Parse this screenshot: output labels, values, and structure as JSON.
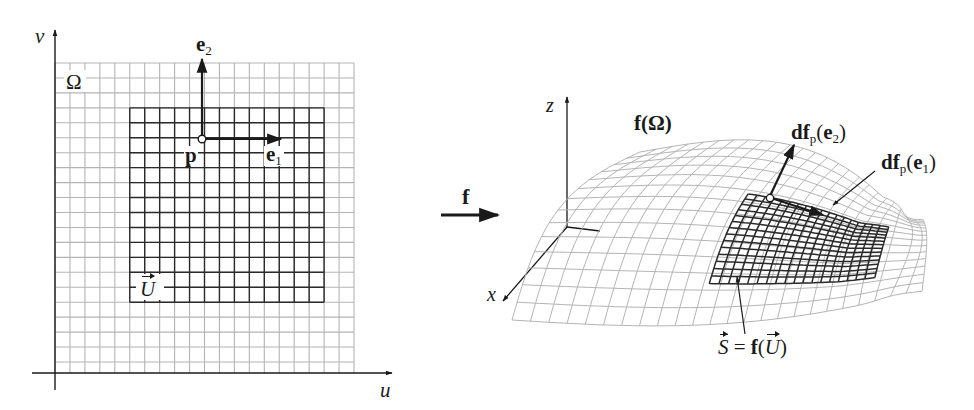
{
  "figure": {
    "colors": {
      "light_grid": "#b4b4b4",
      "dark_grid": "#2a2a2a",
      "axis": "#1a1a1a",
      "background": "#ffffff"
    },
    "left_panel": {
      "axis_u_label": "u",
      "axis_v_label": "v",
      "domain_label": "Ω",
      "subdomain_label": "U",
      "point_label": "p",
      "vector_e1_label": "e",
      "vector_e1_sub": "1",
      "vector_e2_label": "e",
      "vector_e2_sub": "2",
      "grid": {
        "x0": 55,
        "y0": 63,
        "cols": 20,
        "rows": 21,
        "spacing": 14.95,
        "dark_col_start": 5,
        "dark_col_end": 18,
        "dark_row_start": 3,
        "dark_row_end": 16
      }
    },
    "map_arrow": {
      "label": "f"
    },
    "right_panel": {
      "axis_x_label": "x",
      "axis_z_label": "z",
      "surface_label": "f(Ω)",
      "image_label_lhs": "S",
      "image_label_eq": " = ",
      "image_label_f": "f",
      "image_label_open": "(",
      "image_label_U": "U",
      "image_label_close": ")",
      "dfe2_label_prefix": "df",
      "dfe2_sub": "p",
      "dfe2_arg_open": "(",
      "dfe2_arg": "e",
      "dfe2_arg_sub": "2",
      "dfe2_arg_close": ")",
      "dfe1_label_prefix": "df",
      "dfe1_sub": "p",
      "dfe1_arg_open": "(",
      "dfe1_arg": "e",
      "dfe1_arg_sub": "1",
      "dfe1_arg_close": ")"
    }
  }
}
